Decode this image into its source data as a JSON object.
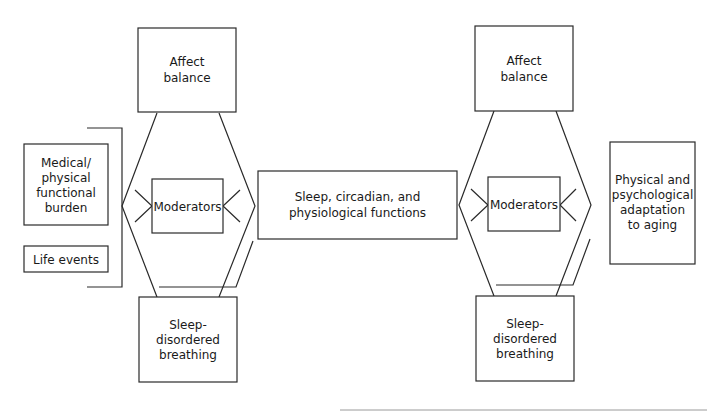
{
  "diagram": {
    "nodes": {
      "affect_balance_left": {
        "lines": [
          "Affect",
          "balance"
        ]
      },
      "sleep_disordered_left": {
        "lines": [
          "Sleep-",
          "disordered",
          "breathing"
        ]
      },
      "moderators_left": {
        "label": "Moderators"
      },
      "medical_burden": {
        "lines": [
          "Medical/",
          "physical",
          "functional",
          "burden"
        ]
      },
      "life_events": {
        "label": "Life events"
      },
      "sleep_circadian": {
        "lines": [
          "Sleep, circadian, and",
          "physiological functions"
        ]
      },
      "affect_balance_right": {
        "lines": [
          "Affect",
          "balance"
        ]
      },
      "sleep_disordered_right": {
        "lines": [
          "Sleep-",
          "disordered",
          "breathing"
        ]
      },
      "moderators_right": {
        "label": "Moderators"
      },
      "physical_adaptation": {
        "lines": [
          "Physical and",
          "psychological",
          "adaptation",
          "to aging"
        ]
      }
    },
    "colors": {
      "stroke": "#2a2a2a",
      "text": "#1a1a1a",
      "background": "#ffffff",
      "rule": "#9a9a9a"
    }
  }
}
